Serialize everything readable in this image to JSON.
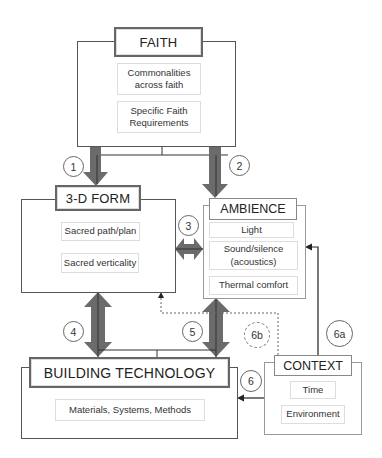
{
  "diagram": {
    "faith": {
      "title": "FAITH",
      "items": [
        "Commonalities across faith",
        "Specific Faith Requirements"
      ]
    },
    "form": {
      "title": "3-D FORM",
      "items": [
        "Sacred path/plan",
        "Sacred verticality"
      ]
    },
    "ambience": {
      "title": "AMBIENCE",
      "items": [
        "Light",
        "Sound/silence (acoustics)",
        "Thermal comfort"
      ]
    },
    "technology": {
      "title": "BUILDING TECHNOLOGY",
      "items": [
        "Materials, Systems, Methods"
      ]
    },
    "context": {
      "title": "CONTEXT",
      "items": [
        "Time",
        "Environment"
      ]
    },
    "links": [
      {
        "label": "1",
        "from": "FAITH",
        "to": "3-D FORM",
        "style": "thick-arrow"
      },
      {
        "label": "2",
        "from": "FAITH",
        "to": "AMBIENCE",
        "style": "thick-arrow"
      },
      {
        "label": "3",
        "from": "3-D FORM",
        "to": "AMBIENCE",
        "style": "thick-double-arrow"
      },
      {
        "label": "4",
        "from": "3-D FORM",
        "to": "BUILDING TECHNOLOGY",
        "style": "thick-double-arrow"
      },
      {
        "label": "5",
        "from": "AMBIENCE",
        "to": "BUILDING TECHNOLOGY",
        "style": "thick-double-arrow"
      },
      {
        "label": "6",
        "from": "CONTEXT",
        "to": "BUILDING TECHNOLOGY",
        "style": "thin-arrow"
      },
      {
        "label": "6a",
        "from": "CONTEXT",
        "to": "AMBIENCE",
        "style": "thin-arrow"
      },
      {
        "label": "6b",
        "from": "CONTEXT",
        "to": "3-D FORM",
        "style": "dashed-arrow"
      }
    ],
    "colors": {
      "arrow_fill": "#6b6b6b",
      "line": "#333333",
      "box_border": "#555555",
      "item_border": "#dddddd"
    }
  }
}
